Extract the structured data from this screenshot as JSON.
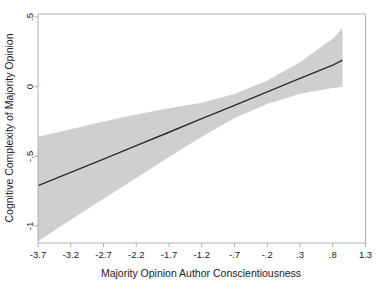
{
  "chart_data": {
    "type": "line",
    "title": "",
    "xlabel": "Majority Opinion Author Conscientiousness",
    "ylabel": "Cognitive Complexity of Majority Opinion",
    "xlim": [
      -3.7,
      1.3
    ],
    "ylim": [
      -1.15,
      0.5
    ],
    "grid": false,
    "legend": null,
    "xticks": [
      -3.7,
      -3.2,
      -2.7,
      -2.2,
      -1.7,
      -1.2,
      -0.7,
      -0.2,
      0.3,
      0.8,
      1.3
    ],
    "xticklabels": [
      "-3.7",
      "-3.2",
      "-2.7",
      "-2.2",
      "-1.7",
      "-1.2",
      "-.7",
      "-.2",
      ".3",
      ".8",
      "1.3"
    ],
    "yticks": [
      0.5,
      0,
      -0.5,
      -1
    ],
    "yticklabels": [
      ".5",
      "0",
      "-.5",
      "-1"
    ],
    "series": [
      {
        "name": "Predicted cognitive complexity (linear fit)",
        "type": "line",
        "color": "#2b2b2b",
        "x": [
          -3.7,
          -3.2,
          -2.7,
          -2.2,
          -1.7,
          -1.2,
          -0.7,
          -0.2,
          0.3,
          0.8,
          0.95
        ],
        "values": [
          -0.71,
          -0.615,
          -0.52,
          -0.423,
          -0.327,
          -0.23,
          -0.134,
          -0.038,
          0.059,
          0.155,
          0.19
        ]
      },
      {
        "name": "95% confidence interval (upper bound)",
        "type": "band-upper",
        "color": "#cfcfcf",
        "x": [
          -3.7,
          -3.2,
          -2.7,
          -2.2,
          -1.7,
          -1.2,
          -0.7,
          -0.2,
          0.3,
          0.8,
          0.95
        ],
        "values": [
          -0.36,
          -0.305,
          -0.25,
          -0.2,
          -0.155,
          -0.115,
          -0.053,
          0.045,
          0.175,
          0.345,
          0.42
        ]
      },
      {
        "name": "95% confidence interval (lower bound)",
        "type": "band-lower",
        "color": "#cfcfcf",
        "x": [
          -3.7,
          -3.2,
          -2.7,
          -2.2,
          -1.7,
          -1.2,
          -0.7,
          -0.2,
          0.3,
          0.8,
          0.95
        ],
        "values": [
          -1.11,
          -0.955,
          -0.805,
          -0.655,
          -0.505,
          -0.36,
          -0.225,
          -0.125,
          -0.05,
          -0.01,
          0.0
        ]
      }
    ],
    "band_fill": "#cfcfcf",
    "line_color": "#2b2b2b",
    "axis_color": "#b0b0b0",
    "background": "#ffffff"
  }
}
